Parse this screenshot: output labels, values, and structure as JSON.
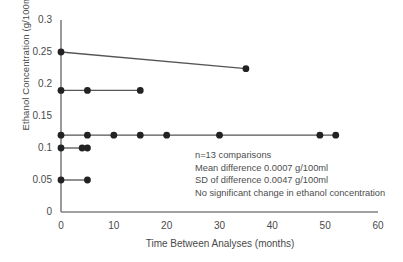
{
  "chart_data": {
    "type": "scatter",
    "title": "",
    "xlabel": "Time Between Analyses (months)",
    "ylabel": "Ethanol Concentration (g/100ml)",
    "xlim": [
      0,
      60
    ],
    "ylim": [
      0,
      0.3
    ],
    "xticks": [
      "0",
      "10",
      "20",
      "30",
      "40",
      "50",
      "60"
    ],
    "xtick_values": [
      0,
      10,
      20,
      30,
      40,
      50,
      60
    ],
    "yticks": [
      "0",
      "0.05",
      "0.1",
      "0.15",
      "0.2",
      "0.25",
      "0.3"
    ],
    "ytick_values": [
      0,
      0.05,
      0.1,
      0.15,
      0.2,
      0.25,
      0.3
    ],
    "grid": false,
    "legend": "none",
    "marker_color": "#222222",
    "line_color": "#555555",
    "axis_color": "#808080",
    "series": [
      {
        "name": "case-1",
        "connected": true,
        "x": [
          0,
          35
        ],
        "y": [
          0.25,
          0.224
        ]
      },
      {
        "name": "case-2",
        "connected": true,
        "x": [
          0,
          5,
          15
        ],
        "y": [
          0.19,
          0.19,
          0.19
        ]
      },
      {
        "name": "case-3",
        "connected": true,
        "x": [
          0,
          5,
          10,
          15,
          20,
          30,
          49,
          52
        ],
        "y": [
          0.12,
          0.12,
          0.12,
          0.12,
          0.12,
          0.12,
          0.12,
          0.12
        ]
      },
      {
        "name": "case-4",
        "connected": true,
        "x": [
          0,
          4,
          5
        ],
        "y": [
          0.1,
          0.1,
          0.1
        ]
      },
      {
        "name": "case-5",
        "connected": true,
        "x": [
          0,
          5
        ],
        "y": [
          0.05,
          0.05
        ]
      }
    ],
    "annotations": [
      "n=13 comparisons",
      "Mean difference 0.0007 g/100ml",
      "SD of difference 0.0047 g/100ml",
      "No significant change in ethanol concentration"
    ]
  },
  "plot_geometry": {
    "x0": 61,
    "x1": 378,
    "y0": 212,
    "y1": 20
  }
}
